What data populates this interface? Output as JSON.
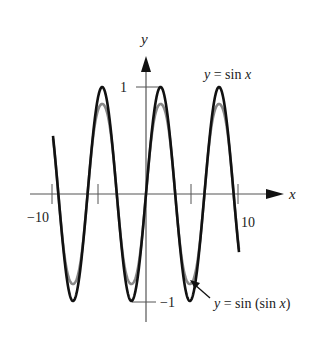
{
  "chart_data": {
    "type": "line",
    "title": "",
    "xlabel": "x",
    "ylabel": "y",
    "xlim": [
      -10,
      10
    ],
    "ylim": [
      -1,
      1
    ],
    "x_ticks": [
      -10,
      -5,
      5,
      10
    ],
    "x_tick_labels": [
      "-10",
      "10"
    ],
    "y_ticks": [
      1,
      -1
    ],
    "y_tick_labels": [
      "1",
      "-1"
    ],
    "grid": false,
    "series": [
      {
        "name": "y = sin x",
        "function": "sin(x)",
        "color": "#111111",
        "amplitude": 1.0
      },
      {
        "name": "y = sin(sin x)",
        "function": "sin(sin(x))",
        "color": "#888888",
        "amplitude": 0.841
      }
    ],
    "annotations": [
      {
        "text": "y = sin x",
        "position": "top-right near peak at x≈5π/2"
      },
      {
        "text": "y = sin(sin x)",
        "position": "bottom-right with arrow to trough near x≈3π/2"
      }
    ]
  },
  "labels": {
    "x_axis": "x",
    "y_axis": "y",
    "tick_neg10": "−10",
    "tick_10": "10",
    "tick_1": "1",
    "tick_neg1": "−1",
    "sinx_label_y": "y",
    "sinx_label_rest": " = sin ",
    "sinx_label_x": "x",
    "sinsin_label_y": "y",
    "sinsin_label_rest": " = sin (sin ",
    "sinsin_label_x": "x",
    "sinsin_label_close": ")"
  }
}
